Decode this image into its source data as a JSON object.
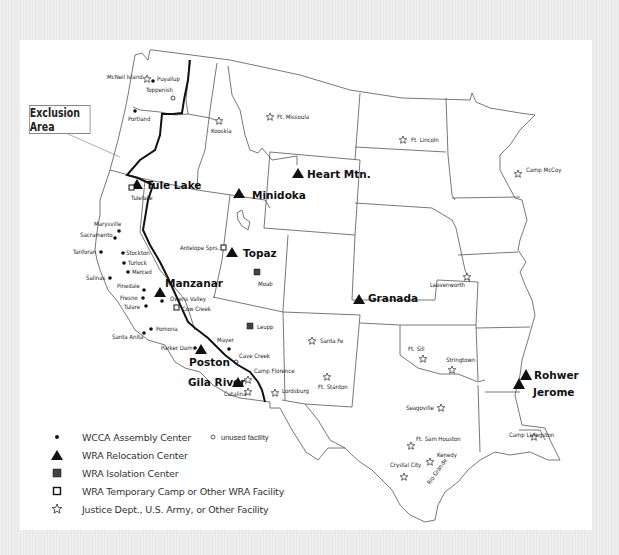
{
  "map": {
    "callout": "Exclusion Area",
    "sites": {
      "wra_relocation": [
        {
          "name": "Tule Lake",
          "x": 137,
          "y": 182
        },
        {
          "name": "Minidoka",
          "x": 239,
          "y": 193
        },
        {
          "name": "Heart Mtn.",
          "x": 298,
          "y": 173
        },
        {
          "name": "Topaz",
          "x": 232,
          "y": 251
        },
        {
          "name": "Manzanar",
          "x": 160,
          "y": 292
        },
        {
          "name": "Granada",
          "x": 359,
          "y": 299
        },
        {
          "name": "Poston",
          "x": 201,
          "y": 348
        },
        {
          "name": "Gila River",
          "x": 238,
          "y": 382
        },
        {
          "name": "Rohwer",
          "x": 526,
          "y": 374
        },
        {
          "name": "Jerome",
          "x": 519,
          "y": 383
        }
      ],
      "wcca_assembly": [
        {
          "name": "Puyallup",
          "x": 153,
          "y": 80
        },
        {
          "name": "Portland",
          "x": 135,
          "y": 110
        },
        {
          "name": "Marysville",
          "x": 119,
          "y": 231
        },
        {
          "name": "Sacramento",
          "x": 115,
          "y": 237
        },
        {
          "name": "Tanforan",
          "x": 101,
          "y": 251
        },
        {
          "name": "Stockton",
          "x": 122,
          "y": 253
        },
        {
          "name": "Turlock",
          "x": 124,
          "y": 263
        },
        {
          "name": "Merced",
          "x": 128,
          "y": 272
        },
        {
          "name": "Salinas",
          "x": 110,
          "y": 277
        },
        {
          "name": "Pinedale",
          "x": 143,
          "y": 290
        },
        {
          "name": "Fresno",
          "x": 143,
          "y": 298
        },
        {
          "name": "Tulare",
          "x": 146,
          "y": 306
        },
        {
          "name": "Owens Valley",
          "x": 162,
          "y": 301
        },
        {
          "name": "Pomona",
          "x": 151,
          "y": 329
        },
        {
          "name": "Santa Anita",
          "x": 144,
          "y": 333
        },
        {
          "name": "Parker Dam",
          "x": 195,
          "y": 348
        },
        {
          "name": "Mayer",
          "x": 229,
          "y": 349
        }
      ],
      "unused_facility": [
        {
          "name": "Toppenish",
          "x": 173,
          "y": 98
        },
        {
          "name": "Cave Creek",
          "x": 236,
          "y": 362
        }
      ],
      "wra_isolation": [
        {
          "name": "Moab",
          "x": 257,
          "y": 272
        },
        {
          "name": "Leupp",
          "x": 250,
          "y": 326
        }
      ],
      "wra_temporary": [
        {
          "name": "Tulelake",
          "x": 133,
          "y": 188
        },
        {
          "name": "Antelope Sprs.",
          "x": 223,
          "y": 248
        },
        {
          "name": "Cow Creek",
          "x": 176,
          "y": 307
        }
      ],
      "justice_army": [
        {
          "name": "McNeil Island",
          "x": 147,
          "y": 79
        },
        {
          "name": "Kooskia",
          "x": 219,
          "y": 122
        },
        {
          "name": "Ft. Missoula",
          "x": 270,
          "y": 117
        },
        {
          "name": "Ft. Lincoln",
          "x": 403,
          "y": 140
        },
        {
          "name": "Camp McCoy",
          "x": 518,
          "y": 174
        },
        {
          "name": "Leavenworth",
          "x": 467,
          "y": 277
        },
        {
          "name": "Santa Fe",
          "x": 312,
          "y": 341
        },
        {
          "name": "Ft. Sill",
          "x": 423,
          "y": 359
        },
        {
          "name": "Stringtown",
          "x": 452,
          "y": 370
        },
        {
          "name": "Ft. Stanton",
          "x": 327,
          "y": 377
        },
        {
          "name": "Lordsburg",
          "x": 275,
          "y": 393
        },
        {
          "name": "Camp Florence",
          "x": 248,
          "y": 380
        },
        {
          "name": "Catalina",
          "x": 248,
          "y": 392
        },
        {
          "name": "Seagoville",
          "x": 441,
          "y": 408
        },
        {
          "name": "Ft. Sam Houston",
          "x": 411,
          "y": 446
        },
        {
          "name": "Kenedy",
          "x": 430,
          "y": 462
        },
        {
          "name": "Crystal City",
          "x": 404,
          "y": 477
        },
        {
          "name": "Camp Livingston",
          "x": 534,
          "y": 437
        }
      ]
    },
    "river_label": "Rio Grande"
  },
  "legend": {
    "items": [
      {
        "symbol": "dot",
        "label": "WCCA Assembly Center",
        "extra": "unused facility"
      },
      {
        "symbol": "triangle",
        "label": "WRA Relocation Center"
      },
      {
        "symbol": "filled-square",
        "label": "WRA Isolation Center"
      },
      {
        "symbol": "open-square",
        "label": "WRA Temporary Camp or Other WRA Facility"
      },
      {
        "symbol": "star",
        "label": "Justice Dept., U.S. Army, or Other Facility"
      }
    ]
  }
}
